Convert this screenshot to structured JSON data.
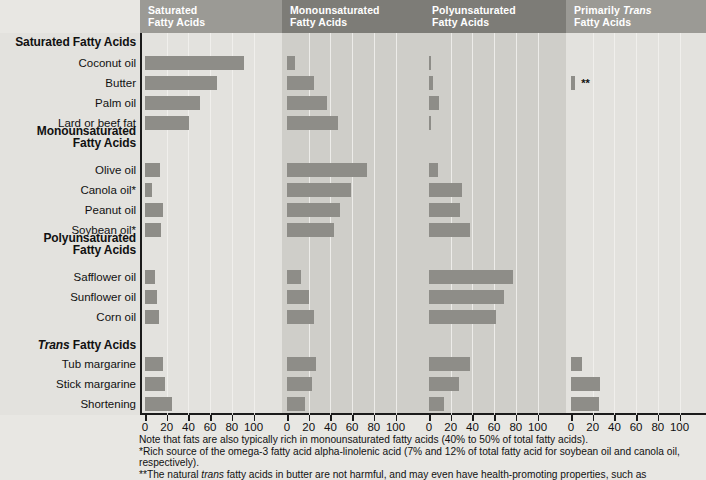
{
  "panels": [
    {
      "id": "saturated",
      "title_line1": "Saturated",
      "title_line2": "Fatty Acids",
      "header_color": "#9b9a95",
      "bg": "#e3e2de"
    },
    {
      "id": "monounsaturated",
      "title_line1": "Monounsaturated",
      "title_line2": "Fatty Acids",
      "header_color": "#7d7c77",
      "bg": "#cfcec9"
    },
    {
      "id": "polyunsaturated",
      "title_line1": "Polyunsaturated",
      "title_line2": "Fatty Acids",
      "header_color": "#7d7c77",
      "bg": "#cfcec9"
    },
    {
      "id": "trans",
      "title_line1": "Primarily Trans",
      "title_line2": "Fatty Acids",
      "header_color": "#9b9a95",
      "bg": "#e3e2de"
    }
  ],
  "axis": {
    "ticks": [
      0,
      20,
      40,
      60,
      80,
      100
    ],
    "min": 0,
    "max": 100
  },
  "groups": [
    {
      "label": "Saturated Fatty Acids",
      "italic_word": null,
      "two_line": false
    },
    {
      "label": "Monounsaturated Fatty Acids",
      "italic_word": null,
      "two_line": true,
      "line1": "Monounsaturated",
      "line2": "Fatty Acids"
    },
    {
      "label": "Polyunsaturated Fatty Acids",
      "italic_word": null,
      "two_line": true,
      "line1": "Polyunsaturated",
      "line2": "Fatty Acids"
    },
    {
      "label": "Trans Fatty Acids",
      "italic_word": "Trans",
      "two_line": false
    }
  ],
  "rows": [
    "Coconut oil",
    "Butter",
    "Palm oil",
    "Lard or beef fat",
    "Olive oil",
    "Canola oil*",
    "Peanut oil",
    "Soybean oil*",
    "Safflower oil",
    "Sunflower oil",
    "Corn oil",
    "Tub margarine",
    "Stick margarine",
    "Shortening"
  ],
  "markers": {
    "butter_trans": "**"
  },
  "notes": [
    "Note that fats are also typically rich in monounsaturated fatty acids (40% to 50% of total fatty acids).",
    "*Rich source of the omega-3 fatty acid alpha-linolenic acid (7% and 12% of total fatty acid for soybean oil and canola oil, respectively).",
    "**The natural trans fatty acids in butter are not harmful, and may even have health-promoting properties, such as"
  ],
  "chart_data": {
    "type": "bar",
    "xlabel": "",
    "ylabel": "",
    "xlim": [
      0,
      100
    ],
    "xticks": [
      0,
      20,
      40,
      60,
      80,
      100
    ],
    "grid": true,
    "legend": "none",
    "orientation": "horizontal",
    "categories": [
      "Coconut oil",
      "Butter",
      "Palm oil",
      "Lard or beef fat",
      "Olive oil",
      "Canola oil*",
      "Peanut oil",
      "Soybean oil*",
      "Safflower oil",
      "Sunflower oil",
      "Corn oil",
      "Tub margarine",
      "Stick margarine",
      "Shortening"
    ],
    "series": [
      {
        "name": "Saturated Fatty Acids",
        "values": [
          91,
          66,
          51,
          41,
          14,
          6,
          17,
          15,
          9,
          11,
          13,
          17,
          18,
          25
        ]
      },
      {
        "name": "Monounsaturated Fatty Acids",
        "values": [
          7,
          25,
          37,
          47,
          74,
          59,
          49,
          43,
          13,
          20,
          25,
          27,
          23,
          17
        ]
      },
      {
        "name": "Polyunsaturated Fatty Acids",
        "values": [
          2,
          4,
          9,
          2,
          8,
          30,
          29,
          38,
          77,
          69,
          62,
          38,
          28,
          14
        ]
      },
      {
        "name": "Primarily Trans Fatty Acids",
        "values": [
          0,
          4,
          0,
          0,
          0,
          0,
          0,
          0,
          0,
          0,
          0,
          10,
          27,
          26
        ]
      }
    ]
  }
}
